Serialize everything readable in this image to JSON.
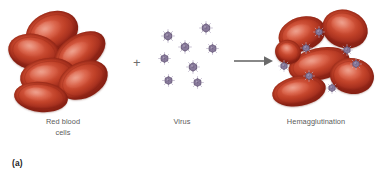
{
  "figure": {
    "caption": "(a)",
    "background_color": "#ffffff",
    "width": 379,
    "height": 186
  },
  "colors": {
    "rbc_fill": "#c04128",
    "rbc_highlight": "#e0705a",
    "rbc_edge": "#8e2417",
    "virus_fill": "#8d7fa0",
    "virus_edge": "#5e5070",
    "virus_spike": "#b9afc6",
    "label_text": "#5b5b5b",
    "symbol": "#6e6e6e"
  },
  "symbols": {
    "plus": "+",
    "arrow_name": "arrow-right-icon"
  },
  "labels": [
    {
      "id": "red-blood-cells",
      "text": "Red blood\ncells"
    },
    {
      "id": "virus",
      "text": "Virus"
    },
    {
      "id": "hemagglutination",
      "text": "Hemagglutination"
    }
  ],
  "groups": {
    "reactants_left": {
      "label": "Red blood\ncells",
      "cell_count": 6
    },
    "reactants_right": {
      "label": "Virus",
      "virus_count": 8
    },
    "product": {
      "label": "Hemagglutination",
      "cell_count": 6,
      "virus_count": 7
    }
  },
  "rbc_left": [
    {
      "x": 25,
      "y": 12,
      "w": 54,
      "h": 40,
      "rot": -22
    },
    {
      "x": 8,
      "y": 34,
      "w": 52,
      "h": 36,
      "rot": 12
    },
    {
      "x": 52,
      "y": 35,
      "w": 56,
      "h": 34,
      "rot": -32
    },
    {
      "x": 20,
      "y": 58,
      "w": 56,
      "h": 36,
      "rot": -8
    },
    {
      "x": 57,
      "y": 62,
      "w": 52,
      "h": 36,
      "rot": -26
    },
    {
      "x": 14,
      "y": 82,
      "w": 54,
      "h": 30,
      "rot": 6
    }
  ],
  "virus_middle": [
    {
      "x": 161,
      "y": 29,
      "s": 14
    },
    {
      "x": 199,
      "y": 21,
      "s": 14
    },
    {
      "x": 178,
      "y": 40,
      "s": 14
    },
    {
      "x": 206,
      "y": 42,
      "s": 13
    },
    {
      "x": 158,
      "y": 52,
      "s": 13
    },
    {
      "x": 186,
      "y": 60,
      "s": 14
    },
    {
      "x": 162,
      "y": 74,
      "s": 13
    },
    {
      "x": 191,
      "y": 76,
      "s": 13
    }
  ],
  "rbc_right": [
    {
      "x": 278,
      "y": 17,
      "w": 48,
      "h": 34,
      "rot": -18
    },
    {
      "x": 322,
      "y": 10,
      "w": 46,
      "h": 38,
      "rot": 18
    },
    {
      "x": 288,
      "y": 48,
      "w": 62,
      "h": 32,
      "rot": -13
    },
    {
      "x": 330,
      "y": 58,
      "w": 44,
      "h": 36,
      "rot": 8
    },
    {
      "x": 272,
      "y": 76,
      "w": 54,
      "h": 30,
      "rot": -10
    },
    {
      "x": 275,
      "y": 40,
      "w": 26,
      "h": 24,
      "rot": 20
    }
  ],
  "virus_right": [
    {
      "x": 313,
      "y": 26,
      "s": 12
    },
    {
      "x": 300,
      "y": 42,
      "s": 12
    },
    {
      "x": 341,
      "y": 44,
      "s": 12
    },
    {
      "x": 278,
      "y": 60,
      "s": 12
    },
    {
      "x": 350,
      "y": 58,
      "s": 12
    },
    {
      "x": 303,
      "y": 70,
      "s": 12
    },
    {
      "x": 326,
      "y": 82,
      "s": 12
    }
  ]
}
